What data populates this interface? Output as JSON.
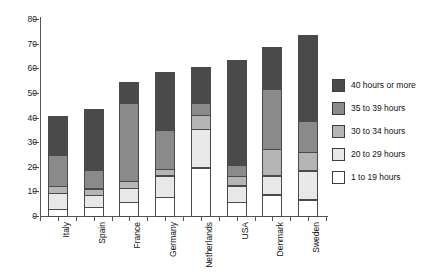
{
  "chart_data": {
    "type": "bar",
    "subtype": "stacked-vertical",
    "title": "",
    "xlabel": "",
    "ylabel": "",
    "ylim": [
      0,
      80
    ],
    "yticks": [
      0,
      10,
      20,
      30,
      40,
      50,
      60,
      70,
      80
    ],
    "grid": false,
    "legend_position": "right",
    "categories": [
      "Italy",
      "Spain",
      "France",
      "Germany",
      "Netherlands",
      "USA",
      "Denmark",
      "Sweden"
    ],
    "series": [
      {
        "name": "1 to 19 hours",
        "color": "#ffffff",
        "values": [
          3,
          4,
          6,
          8,
          20,
          6,
          9,
          7
        ]
      },
      {
        "name": "20 to 29 hours",
        "color": "#e8e8e8",
        "values": [
          7,
          5,
          6,
          9,
          16,
          7,
          8,
          12
        ]
      },
      {
        "name": "30 to 34 hours",
        "color": "#b5b5b5",
        "values": [
          3,
          3,
          3,
          3,
          6,
          4,
          11,
          8
        ]
      },
      {
        "name": "35 to 39 hours",
        "color": "#8a8a8a",
        "values": [
          13,
          8,
          32,
          16,
          5,
          5,
          25,
          13
        ]
      },
      {
        "name": "40 hours or more",
        "color": "#4a4a4a",
        "values": [
          16,
          25,
          9,
          24,
          15,
          43,
          17,
          35
        ]
      }
    ],
    "totals": [
      42,
      45,
      56,
      60,
      62,
      65,
      70,
      75
    ],
    "legend_order": [
      "40 hours or more",
      "35 to 39 hours",
      "30 to 34 hours",
      "20 to 29 hours",
      "1 to 19 hours"
    ]
  },
  "axis": {
    "tick_labels": [
      "80",
      "70",
      "60",
      "50",
      "40",
      "30",
      "20",
      "10",
      "0"
    ]
  }
}
